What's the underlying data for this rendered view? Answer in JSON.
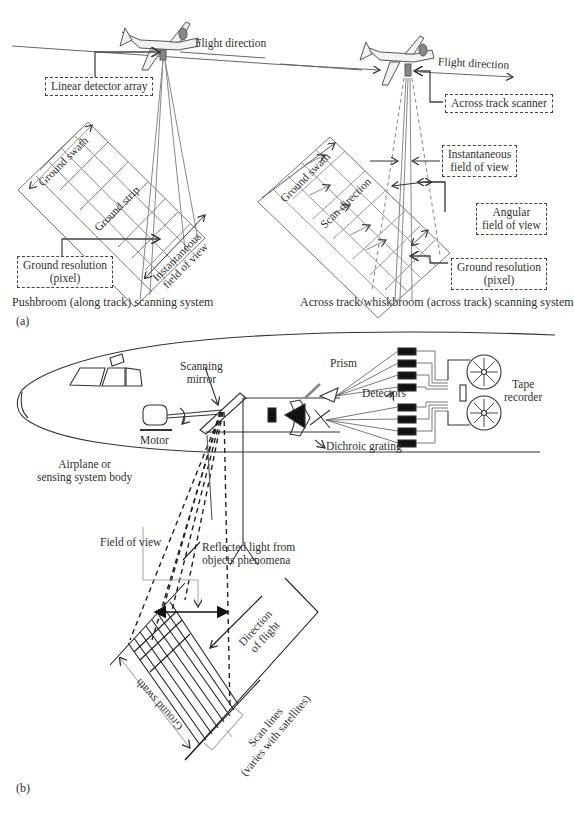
{
  "figure": {
    "part_a": {
      "label": "(a)",
      "pushbroom": {
        "caption": "Pushbroom (along track) scanning system",
        "flight_direction": "Flight direction",
        "linear_detector_array": "Linear detector array",
        "ground_swath": "Ground swath",
        "ground_strip": "Ground strip",
        "ifov_line1": "Instantaneous",
        "ifov_line2": "field of view",
        "ground_resolution_line1": "Ground resolution",
        "ground_resolution_line2": "(pixel)"
      },
      "whiskbroom": {
        "caption": "Across track/whiskbroom (across track) scanning system",
        "flight_direction": "Flight direction",
        "across_track_scanner": "Across track scanner",
        "ifov_line1": "Instantaneous",
        "ifov_line2": "field of view",
        "angular_line1": "Angular",
        "angular_line2": "field of view",
        "ground_swath": "Ground swath",
        "scan_direction": "Scan direction",
        "ground_resolution_line1": "Ground resolution",
        "ground_resolution_line2": "(pixel)"
      }
    },
    "part_b": {
      "label": "(b)",
      "scanning_mirror_line1": "Scanning",
      "scanning_mirror_line2": "mirror",
      "prism": "Prism",
      "detectors": "Detectors",
      "tape_recorder_line1": "Tape",
      "tape_recorder_line2": "recorder",
      "motor": "Motor",
      "dichroic_grating": "Dichroic grating",
      "airplane_line1": "Airplane or",
      "airplane_line2": "sensing system body",
      "field_of_view": "Field of view",
      "reflected_line1": "Reflected light from",
      "reflected_line2": "objects phenomena",
      "direction_line1": "Direction",
      "direction_line2": "of flight",
      "ground_swath": "Ground swath",
      "scan_lines_line1": "Scan lines",
      "scan_lines_line2": "(varies with satellites)"
    }
  }
}
